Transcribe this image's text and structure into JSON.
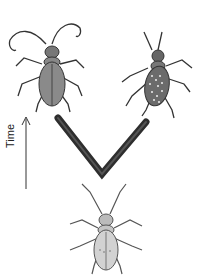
{
  "diagram": {
    "type": "evolutionary-divergence",
    "axis_label": "Time",
    "nodes": [
      {
        "id": "ancestor",
        "position": "bottom-center",
        "description": "pale ancestral beetle with faint spots"
      },
      {
        "id": "descendant-left",
        "position": "top-left",
        "description": "plain dark-bodied beetle with long curved antennae"
      },
      {
        "id": "descendant-right",
        "position": "top-right",
        "description": "dark beetle with light speckled wing covers"
      }
    ],
    "edges": [
      {
        "from": "ancestor",
        "to": "descendant-left"
      },
      {
        "from": "ancestor",
        "to": "descendant-right"
      }
    ],
    "colors": {
      "branch": "#333333",
      "beetle_dark": "#6b6b6b",
      "beetle_light": "#cfcfcf",
      "text": "#222222"
    }
  }
}
